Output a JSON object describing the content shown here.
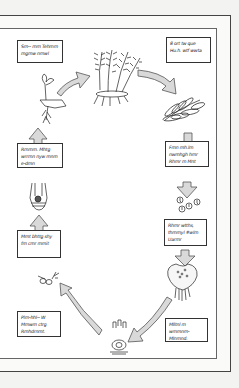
{
  "diagram": {
    "colors": {
      "arrow_fill": "#d9d9d9",
      "arrow_stroke": "#555555",
      "ink": "#222222",
      "paper": "#ffffff",
      "background": "#f3f3f1"
    },
    "stages": [
      {
        "id": "young-sporophyte",
        "label": "Sm-- mm Tehmm mgmw nmwl"
      },
      {
        "id": "mature-fern",
        "label": ""
      },
      {
        "id": "fronds-sori",
        "label": "8 ort tw que Hu.h. wtf wwta"
      },
      {
        "id": "sporangia",
        "label": "Fmn mh.lm nwmhgh hmr Rhmr m Mnt"
      },
      {
        "id": "spores",
        "label": "Rhmr wtths, thmmyl #wlm Uarmr"
      },
      {
        "id": "prothallus",
        "label": "Mlltnl m wmmnm- Mlnmnd."
      },
      {
        "id": "antheridium",
        "label": ""
      },
      {
        "id": "archegonium-sperm",
        "label": "Plm-hhl-- W Mmwm ctrg Rmhdrnmt."
      },
      {
        "id": "fertilization",
        "label": "Mmt bhttg shy fm cmr mmit"
      },
      {
        "id": "zygote",
        "label": "Rmmm. Mhtg wrrmn nyw mnm e-dmn"
      }
    ],
    "arrows": [
      {
        "from": "young-sporophyte",
        "to": "mature-fern",
        "direction": "up-right"
      },
      {
        "from": "mature-fern",
        "to": "fronds-sori",
        "direction": "down-right"
      },
      {
        "from": "fronds-sori",
        "to": "sporangia",
        "direction": "down"
      },
      {
        "from": "sporangia",
        "to": "spores",
        "direction": "down"
      },
      {
        "from": "spores",
        "to": "prothallus",
        "direction": "down"
      },
      {
        "from": "prothallus",
        "to": "antheridium",
        "direction": "down-left"
      },
      {
        "from": "antheridium",
        "to": "fertilization",
        "direction": "up-left"
      },
      {
        "from": "fertilization",
        "to": "zygote",
        "direction": "up"
      },
      {
        "from": "zygote",
        "to": "young-sporophyte",
        "direction": "up"
      }
    ]
  }
}
